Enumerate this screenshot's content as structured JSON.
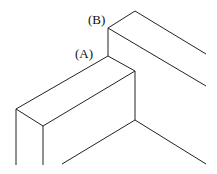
{
  "diagram": {
    "type": "isometric-line-drawing",
    "labels": [
      {
        "id": "A",
        "text": "(A)",
        "x": 75,
        "y": 58
      },
      {
        "id": "B",
        "text": "(B)",
        "x": 88,
        "y": 24
      }
    ],
    "stroke_color": "#222222",
    "background": "#ffffff",
    "lines": [
      [
        108,
        28,
        135,
        11
      ],
      [
        135,
        11,
        206,
        54
      ],
      [
        108,
        28,
        206,
        86
      ],
      [
        108,
        28,
        108,
        56
      ],
      [
        108,
        56,
        16,
        109
      ],
      [
        108,
        56,
        135,
        71
      ],
      [
        135,
        71,
        43,
        126
      ],
      [
        16,
        109,
        43,
        126
      ],
      [
        16,
        109,
        16,
        165
      ],
      [
        43,
        126,
        43,
        165
      ],
      [
        135,
        71,
        135,
        120
      ],
      [
        135,
        120,
        62,
        164
      ],
      [
        135,
        120,
        206,
        164
      ]
    ]
  }
}
